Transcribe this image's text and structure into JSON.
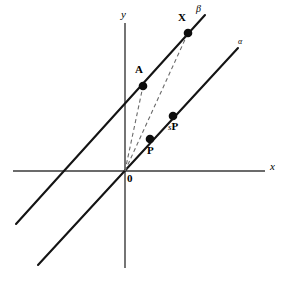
{
  "figure": {
    "width": 287,
    "height": 289,
    "background": "#ffffff",
    "stroke_color": "#1a1a1a",
    "dash_color": "#555555"
  },
  "axes": {
    "x_label": "x",
    "y_label": "y",
    "origin_label": "0",
    "x_axis": {
      "x1": 13,
      "y1": 171,
      "x2": 265,
      "y2": 171
    },
    "y_axis": {
      "x1": 125,
      "y1": 23,
      "x2": 125,
      "y2": 268
    }
  },
  "lines": [
    {
      "name": "beta",
      "label": "β",
      "x1": 16,
      "y1": 224,
      "x2": 205,
      "y2": 15
    },
    {
      "name": "alpha",
      "label": "α",
      "x1": 38,
      "y1": 265,
      "x2": 238,
      "y2": 48
    }
  ],
  "dashed_segments": [
    {
      "name": "origin-to-A",
      "x1": 125,
      "y1": 171,
      "x2": 143,
      "y2": 86
    },
    {
      "name": "origin-to-X",
      "x1": 125,
      "y1": 171,
      "x2": 188,
      "y2": 33
    }
  ],
  "points": [
    {
      "name": "X",
      "label": "X",
      "x": 188,
      "y": 33,
      "r": 4.2
    },
    {
      "name": "A",
      "label": "A",
      "x": 143,
      "y": 86,
      "r": 4.2
    },
    {
      "name": "sP",
      "label": "sP",
      "label_s": "s",
      "label_p": "P",
      "x": 173,
      "y": 116,
      "r": 4.2
    },
    {
      "name": "P",
      "label": "P",
      "x": 150,
      "y": 139,
      "r": 4.2
    }
  ]
}
